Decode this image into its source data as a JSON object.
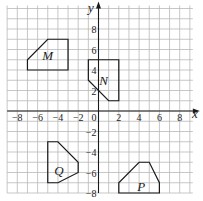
{
  "diagram": {
    "type": "coordinate-grid",
    "axes": {
      "x_label": "x",
      "y_label": "y",
      "x_range": [
        -9,
        9
      ],
      "y_range": [
        -8,
        10
      ],
      "origin_label": "0",
      "x_ticks": [
        "-8",
        "-6",
        "-4",
        "-2",
        "2",
        "4",
        "6",
        "8"
      ],
      "y_ticks": [
        "8",
        "6",
        "4",
        "2",
        "-2",
        "-4",
        "-6",
        "-8"
      ]
    },
    "shapes": [
      {
        "label": "M",
        "vertices": [
          [
            -7,
            4
          ],
          [
            -3,
            4
          ],
          [
            -3,
            7
          ],
          [
            -5,
            7
          ],
          [
            -7,
            5
          ]
        ],
        "label_pos": [
          -5,
          5.5
        ]
      },
      {
        "label": "N",
        "vertices": [
          [
            -1,
            5
          ],
          [
            2,
            5
          ],
          [
            2,
            1
          ],
          [
            1,
            1
          ],
          [
            -1,
            3
          ]
        ],
        "label_pos": [
          0.5,
          3.0
        ]
      },
      {
        "label": "Q",
        "vertices": [
          [
            -5,
            -3
          ],
          [
            -4,
            -3
          ],
          [
            -2,
            -5
          ],
          [
            -2,
            -6
          ],
          [
            -4,
            -7
          ],
          [
            -5,
            -7
          ]
        ],
        "label_pos": [
          -3.9,
          -5.8
        ]
      },
      {
        "label": "P",
        "vertices": [
          [
            2,
            -8
          ],
          [
            6,
            -8
          ],
          [
            6,
            -7
          ],
          [
            5,
            -5
          ],
          [
            4,
            -5
          ],
          [
            2,
            -7
          ]
        ],
        "label_pos": [
          4.2,
          -7.3
        ]
      }
    ],
    "colors": {
      "grid": "#b9b9b9",
      "ink": "#1a1a1a"
    }
  }
}
